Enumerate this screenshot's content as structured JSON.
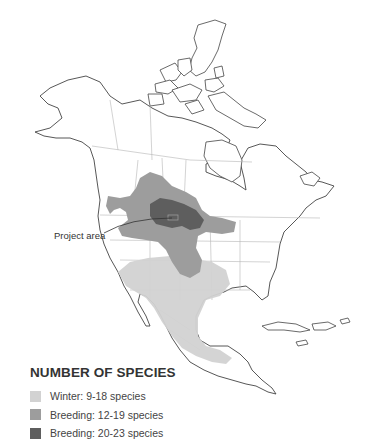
{
  "map": {
    "region": "North America",
    "callout": {
      "label": "Project area"
    },
    "colors": {
      "land": "#ffffff",
      "outline": "#444444",
      "borders": "#b5b5b5",
      "winter": "#d2d2d2",
      "breeding_low": "#9d9d9d",
      "breeding_high": "#5e5e5e"
    }
  },
  "legend": {
    "title": "NUMBER OF SPECIES",
    "items": [
      {
        "label": "Winter: 9-18 species",
        "color": "#d2d2d2"
      },
      {
        "label": "Breeding: 12-19 species",
        "color": "#9d9d9d"
      },
      {
        "label": "Breeding: 20-23 species",
        "color": "#5e5e5e"
      }
    ]
  }
}
